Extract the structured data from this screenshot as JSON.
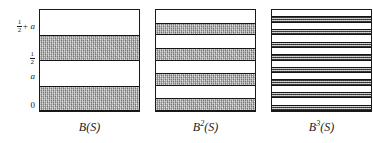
{
  "figure": {
    "axis": {
      "name": "y-axis",
      "ticks": [
        {
          "label": "1/2 + a",
          "numerator": "1",
          "denominator": "2",
          "suffix": "+ a",
          "value": 0.75,
          "kind": "fraction-plus"
        },
        {
          "label": "1/2",
          "numerator": "1",
          "denominator": "2",
          "suffix": "",
          "value": 0.5,
          "kind": "fraction"
        },
        {
          "label": "a",
          "numerator": "",
          "denominator": "",
          "suffix": "a",
          "value": 0.25,
          "kind": "plain"
        },
        {
          "label": "0",
          "numerator": "",
          "denominator": "",
          "suffix": "0",
          "value": 0.0,
          "kind": "plain"
        }
      ]
    },
    "colors": {
      "band_fill": "#a9a9a9",
      "band_fill_thin": "#8e8e8e",
      "border": "#151515",
      "background": "#ffffff",
      "text": "#1a1a1a"
    },
    "panels": [
      {
        "id": "panel-1",
        "caption_base": "B",
        "caption_exponent": "",
        "caption_arg": "(S)",
        "caption": "B(S)",
        "band_count": 2,
        "band_style": "thick",
        "bands": [
          {
            "bottom": 0.0,
            "top": 0.25
          },
          {
            "bottom": 0.5,
            "top": 0.75
          }
        ]
      },
      {
        "id": "panel-2",
        "caption_base": "B",
        "caption_exponent": "2",
        "caption_arg": "(S)",
        "caption": "B²(S)",
        "band_count": 4,
        "band_style": "thick",
        "bands": [
          {
            "bottom": 0.0,
            "top": 0.125
          },
          {
            "bottom": 0.25,
            "top": 0.375
          },
          {
            "bottom": 0.5,
            "top": 0.625
          },
          {
            "bottom": 0.75,
            "top": 0.875
          }
        ]
      },
      {
        "id": "panel-3",
        "caption_base": "B",
        "caption_exponent": "3",
        "caption_arg": "(S)",
        "caption": "B³(S)",
        "band_count": 8,
        "band_style": "thin",
        "bands": [
          {
            "bottom": 0.0,
            "top": 0.0625
          },
          {
            "bottom": 0.125,
            "top": 0.1875
          },
          {
            "bottom": 0.25,
            "top": 0.3125
          },
          {
            "bottom": 0.375,
            "top": 0.4375
          },
          {
            "bottom": 0.5,
            "top": 0.5625
          },
          {
            "bottom": 0.625,
            "top": 0.6875
          },
          {
            "bottom": 0.75,
            "top": 0.8125
          },
          {
            "bottom": 0.875,
            "top": 0.9375
          }
        ]
      }
    ]
  },
  "chart_data": {
    "type": "bar",
    "title": "",
    "xlabel": "",
    "ylabel": "",
    "ylim": [
      0,
      1
    ],
    "grid": false,
    "legend": "none",
    "note": "Three square panels, each a unit-height vertical interval filled with horizontal shaded bands; band count doubles from panel to panel (2, 4, 8) while each band halves in height.",
    "categories": [
      "B(S)",
      "B²(S)",
      "B³(S)"
    ],
    "values": [
      2,
      4,
      8
    ],
    "y_tick_labels": [
      "0",
      "a",
      "1/2",
      "1/2 + a"
    ],
    "y_tick_values": [
      0.0,
      0.25,
      0.5,
      0.75
    ],
    "series": [
      {
        "name": "B(S)",
        "band_intervals": [
          [
            0.0,
            0.25
          ],
          [
            0.5,
            0.75
          ]
        ]
      },
      {
        "name": "B²(S)",
        "band_intervals": [
          [
            0.0,
            0.125
          ],
          [
            0.25,
            0.375
          ],
          [
            0.5,
            0.625
          ],
          [
            0.75,
            0.875
          ]
        ]
      },
      {
        "name": "B³(S)",
        "band_intervals": [
          [
            0.0,
            0.0625
          ],
          [
            0.125,
            0.1875
          ],
          [
            0.25,
            0.3125
          ],
          [
            0.375,
            0.4375
          ],
          [
            0.5,
            0.5625
          ],
          [
            0.625,
            0.6875
          ],
          [
            0.75,
            0.8125
          ],
          [
            0.875,
            0.9375
          ]
        ]
      }
    ]
  }
}
